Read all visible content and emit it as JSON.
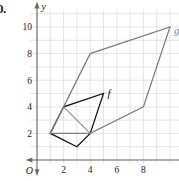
{
  "problem": {
    "number": "0."
  },
  "axes": {
    "x_label": "x",
    "y_label": "y",
    "origin_label": "O",
    "x_ticks": [
      "2",
      "4",
      "6",
      "8"
    ],
    "y_ticks": [
      "2",
      "4",
      "6",
      "8",
      "10"
    ]
  },
  "shape_labels": {
    "f": "f",
    "g": "g"
  },
  "colors": {
    "figure_f": "#111111",
    "figure_g": "#7d7d84",
    "grid": "#d9d9dd",
    "axis": "#6b6b6b"
  },
  "chart_data": {
    "type": "scatter",
    "title": "",
    "xlabel": "x",
    "ylabel": "y",
    "xlim": [
      0,
      11
    ],
    "ylim": [
      0,
      11
    ],
    "xticks": [
      2,
      4,
      6,
      8
    ],
    "yticks": [
      2,
      4,
      6,
      8,
      10
    ],
    "grid": true,
    "legend": "none",
    "series": [
      {
        "name": "f",
        "kind": "polygon",
        "color": "#111111",
        "closed": true,
        "points": [
          [
            1,
            2
          ],
          [
            2,
            4
          ],
          [
            5,
            5
          ],
          [
            4,
            2
          ],
          [
            3,
            1
          ]
        ],
        "label": "f",
        "label_at": [
          5.3,
          4.7
        ]
      },
      {
        "name": "g",
        "kind": "polygon",
        "color": "#7d7d84",
        "closed": true,
        "points": [
          [
            1,
            2
          ],
          [
            4,
            8
          ],
          [
            10,
            10
          ],
          [
            8,
            4
          ],
          [
            4,
            2
          ]
        ],
        "label": "g",
        "label_at": [
          10.3,
          9.5
        ]
      },
      {
        "name": "connector",
        "kind": "segment",
        "color": "#8a8a90",
        "points": [
          [
            2,
            4
          ],
          [
            4,
            2
          ]
        ]
      }
    ],
    "annotations": [
      {
        "text": "f",
        "x": 5.3,
        "y": 4.7
      },
      {
        "text": "g",
        "x": 10.3,
        "y": 9.5
      }
    ]
  }
}
